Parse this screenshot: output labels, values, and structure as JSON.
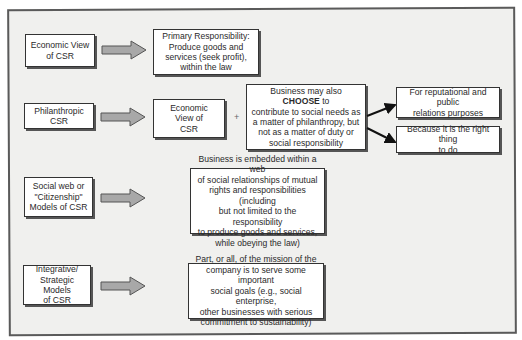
{
  "diagram": {
    "rows": [
      {
        "model": "Economic View of CSR",
        "model_lines": [
          "Economic View",
          "of CSR"
        ],
        "result_lines": [
          "Primary Responsibility:",
          "Produce goods and",
          "services (seek profit),",
          "within the law"
        ]
      },
      {
        "model": "Philanthropic CSR",
        "model_lines": [
          "Philanthropic",
          "CSR"
        ],
        "base_lines": [
          "Economic",
          "View of",
          "CSR"
        ],
        "plus": "+",
        "choice_lines": {
          "pre": "Business may also ",
          "emphasis": "CHOOSE",
          "post": " to",
          "rest": [
            "contribute to social needs as",
            "a matter of philanthropy, but",
            "not as a matter of duty or",
            "social responsibility"
          ]
        },
        "reasons": [
          {
            "lines": [
              "For reputational and public",
              "relations purposes"
            ]
          },
          {
            "lines": [
              "Because it is the right thing",
              "to do"
            ]
          }
        ]
      },
      {
        "model": "Social web or \"Citizenship\" Models of CSR",
        "model_lines": [
          "Social web or",
          "\"Citizenship\"",
          "Models of CSR"
        ],
        "result_lines": [
          "Business is embedded within a web",
          "of social relationships of mutual",
          "rights and responsibilities (including",
          "but not limited to the responsibility",
          "to produce goods and services,",
          "while obeying the law)"
        ]
      },
      {
        "model": "Integrative/ Strategic Models of CSR",
        "model_lines": [
          "Integrative/",
          "Strategic Models",
          "of CSR"
        ],
        "result_lines": [
          "Part, or all, of the mission of the",
          "company is to serve some important",
          "social goals (e.g., social enterprise,",
          "other businesses with serious",
          "commitment to sustainability)"
        ]
      }
    ],
    "colors": {
      "frame_bg": "#f0f0ee",
      "arrow_fill": "#a8a8a8",
      "border": "#333333"
    }
  }
}
